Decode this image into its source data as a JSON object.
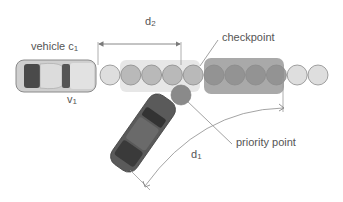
{
  "labels": {
    "vehicle": {
      "text": "vehicle c",
      "sub": "1"
    },
    "velocity": {
      "text": "v",
      "sub": "1"
    },
    "d2": {
      "text": "d",
      "sub": "2"
    },
    "d1": {
      "text": "d",
      "sub": "1"
    },
    "checkpoint": "checkpoint",
    "priority_point": "priority point"
  },
  "colors": {
    "path_circle_light": "#d8d8d8",
    "path_circle_dark": "#8f8f8f",
    "priority_circle": "#8a8a8a",
    "line": "#9a9a9a",
    "car_light_body": "#c9c9c9",
    "car_dark_body": "#5a5a5a",
    "text": "#555555"
  },
  "path_circles": {
    "count": 11,
    "shading": [
      "light",
      "medium",
      "medium",
      "medium",
      "medium",
      "dark",
      "dark",
      "dark",
      "dark",
      "light",
      "light"
    ]
  }
}
